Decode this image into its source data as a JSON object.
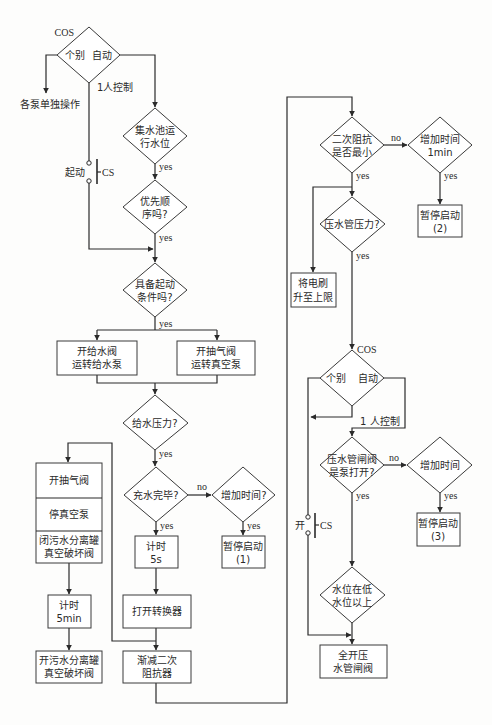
{
  "left_section": {
    "cos_switch": {
      "tag": "COS",
      "option_individual": "个别",
      "option_auto": "自动",
      "branch_one_person": "1人控制"
    },
    "individual_result": "各泵单独操作",
    "start_switch": {
      "label": "起动",
      "tag": "CS"
    },
    "decision_sump_level": {
      "lines": [
        "集水池运",
        "行水位"
      ],
      "yes": "yes"
    },
    "decision_priority": {
      "lines": [
        "优先顺",
        "序吗?"
      ],
      "yes": "yes"
    },
    "decision_start_conditions": {
      "lines": [
        "具备起动",
        "条件吗?"
      ],
      "yes": "yes"
    },
    "box_feed_valve": {
      "lines": [
        "开给水阀",
        "运转给水泵"
      ]
    },
    "box_air_valve": {
      "lines": [
        "开抽气阀",
        "运转真空泵"
      ]
    },
    "decision_feed_pressure": {
      "lines": [
        "给水压力?"
      ],
      "yes": "yes"
    },
    "decision_filling_done": {
      "lines": [
        "充水完毕?"
      ],
      "yes": "yes",
      "no": "no"
    },
    "decision_add_time_1": {
      "lines": [
        "增加时间?"
      ],
      "yes": "yes"
    },
    "box_pause_1": {
      "lines": [
        "暂停启动",
        "(1)"
      ]
    },
    "box_timer_5s": {
      "lines": [
        "计时",
        "5s"
      ]
    },
    "box_open_converter": {
      "lines": [
        "打开转换器"
      ]
    },
    "box_reduce_impedance": {
      "lines": [
        "渐减二次",
        "阻抗器"
      ]
    },
    "stack_vacuum": {
      "row1": "开抽气阀",
      "row2": "停真空泵",
      "row3": [
        "闭污水分离罐",
        "真空破坏阀"
      ]
    },
    "box_timer_5min": {
      "lines": [
        "计时",
        "5min"
      ]
    },
    "box_open_breaker": {
      "lines": [
        "开污水分离罐",
        "真空破坏阀"
      ]
    }
  },
  "right_section": {
    "decision_impedance_min": {
      "lines": [
        "二次阻抗",
        "是否最小"
      ],
      "yes": "yes",
      "no": "no"
    },
    "decision_add_time_2": {
      "lines": [
        "增加时间",
        "1min"
      ],
      "yes": "yes"
    },
    "box_pause_2": {
      "lines": [
        "暂停启动",
        "(2)"
      ]
    },
    "box_raise_brush": {
      "lines": [
        "将电刷",
        "升至上限"
      ]
    },
    "decision_discharge_pressure": {
      "lines": [
        "压水管压力?"
      ],
      "yes": "yes"
    },
    "cos_switch": {
      "tag": "COS",
      "option_individual": "个别",
      "option_auto": "自动",
      "branch_one_person": "1 人控制"
    },
    "open_switch": {
      "label": "开",
      "tag": "CS"
    },
    "decision_gate_valve": {
      "lines": [
        "压水管闸阀",
        "是泵打开?"
      ],
      "yes": "yes",
      "no": "no"
    },
    "decision_add_time_3": {
      "lines": [
        "增加时间"
      ],
      "yes": "yes"
    },
    "box_pause_3": {
      "lines": [
        "暂停启动",
        "(3)"
      ]
    },
    "decision_water_level": {
      "lines": [
        "水位在低",
        "水位以上"
      ]
    },
    "box_full_open": {
      "lines": [
        "全开压",
        "水管闸阀"
      ]
    }
  },
  "colors": {
    "line": "#2a2a2a",
    "shape_border": "#3a3a3a",
    "background": "#fdfdfc"
  }
}
